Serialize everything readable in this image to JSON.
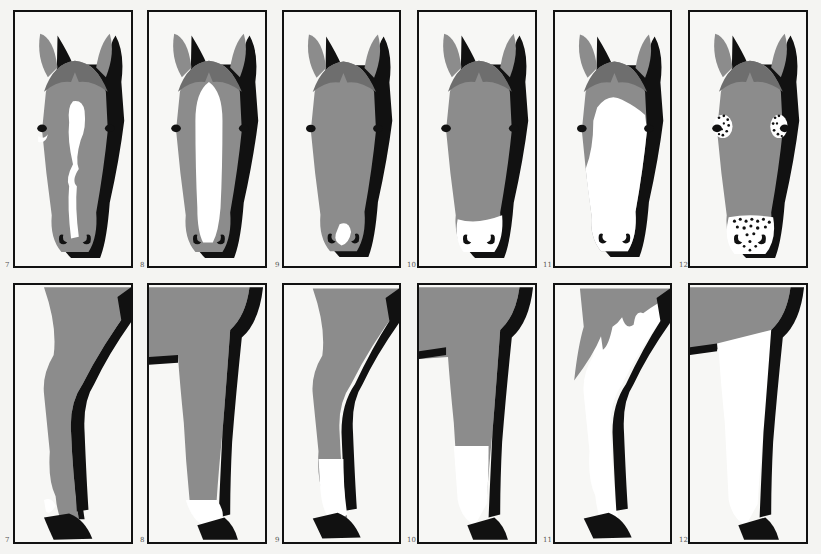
{
  "colors": {
    "coat": "#8c8c8c",
    "forelock_shadow": "#6e6e6e",
    "shadow": "#111111",
    "white": "#ffffff",
    "background": "#f7f7f5",
    "frame": "#111111"
  },
  "faces": [
    {
      "number": "7",
      "marking": "irregular blaze with snip"
    },
    {
      "number": "8",
      "marking": "bald face / wide blaze"
    },
    {
      "number": "9",
      "marking": "snip"
    },
    {
      "number": "10",
      "marking": "white muzzle"
    },
    {
      "number": "11",
      "marking": "apron face"
    },
    {
      "number": "12",
      "marking": "spotted (appaloosa) eyes and muzzle"
    }
  ],
  "legs": [
    {
      "number": "7",
      "marking": "white pastern spots"
    },
    {
      "number": "8",
      "marking": "white pastern / sock"
    },
    {
      "number": "9",
      "marking": "white sock"
    },
    {
      "number": "10",
      "marking": "half stocking"
    },
    {
      "number": "11",
      "marking": "irregular stocking extending to body"
    },
    {
      "number": "12",
      "marking": "full stocking"
    }
  ]
}
